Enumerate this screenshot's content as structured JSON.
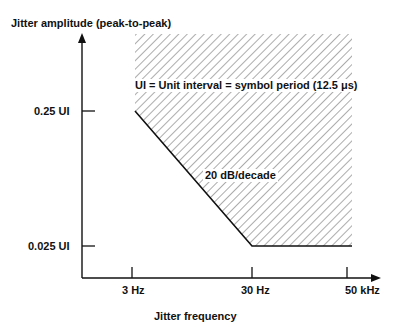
{
  "diagram": {
    "y_axis_title": "Jitter amplitude (peak-to-peak)",
    "x_axis_title": "Jitter frequency",
    "y_ticks": [
      {
        "label": "0.25 UI"
      },
      {
        "label": "0.025 UI"
      }
    ],
    "x_ticks": [
      {
        "label": "3 Hz"
      },
      {
        "label": "30 Hz"
      },
      {
        "label": "50 kHz"
      }
    ],
    "annotation_ui": "UI = Unit interval = symbol period (12.5 μs)",
    "annotation_slope": "20 dB/decade",
    "colors": {
      "line": "#111111",
      "hatch": "#555555",
      "background": "#ffffff"
    }
  }
}
